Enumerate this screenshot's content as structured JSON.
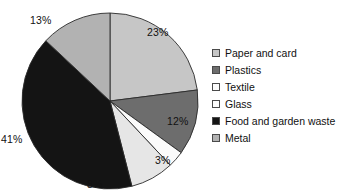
{
  "chart_data": {
    "type": "pie",
    "title": "",
    "subtitle": "",
    "xlabel": "",
    "ylabel": "",
    "grid": false,
    "legend_position": "right",
    "start_angle_deg": 0,
    "direction": "clockwise",
    "categories": [
      "Paper and card",
      "Plastics",
      "Glass",
      "Textile",
      "Food and garden waste",
      "Metal"
    ],
    "values": [
      23,
      12,
      3,
      8,
      41,
      13
    ],
    "value_unit": "%",
    "data_labels": [
      "23%",
      "12%",
      "3%",
      "8%",
      "41%",
      "13%"
    ],
    "slices": [
      {
        "label": "Paper and card",
        "value": 23,
        "data_label": "23%",
        "color": "#c6c6c6"
      },
      {
        "label": "Plastics",
        "value": 12,
        "data_label": "12%",
        "color": "#6d6d6d"
      },
      {
        "label": "Glass",
        "value": 3,
        "data_label": "3%",
        "color": "#fbfbfb"
      },
      {
        "label": "Textile",
        "value": 8,
        "data_label": "8%",
        "color": "#e6e6e6"
      },
      {
        "label": "Food and garden waste",
        "value": 41,
        "data_label": "41%",
        "color": "#141414"
      },
      {
        "label": "Metal",
        "value": 13,
        "data_label": "13%",
        "color": "#b2b2b2"
      }
    ]
  },
  "legend": {
    "items": [
      {
        "label": "Paper and card",
        "swatch": "#c6c6c6"
      },
      {
        "label": "Plastics",
        "swatch": "#6d6d6d"
      },
      {
        "label": "Textile",
        "swatch": "#fbfbfb"
      },
      {
        "label": "Glass",
        "swatch": "#fdfdfd"
      },
      {
        "label": "Food and garden waste",
        "swatch": "#141414"
      },
      {
        "label": "Metal",
        "swatch": "#b2b2b2"
      }
    ]
  },
  "labels": {
    "paper": "23%",
    "plastics": "12%",
    "glass": "3%",
    "textile": "8%",
    "food": "41%",
    "metal": "13%"
  }
}
